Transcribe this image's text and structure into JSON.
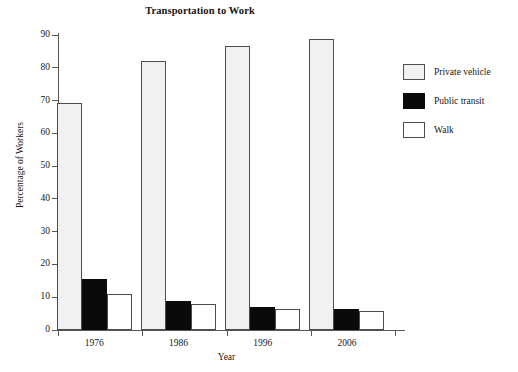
{
  "chart_data": {
    "type": "bar",
    "title": "Transportation to Work",
    "xlabel": "Year",
    "ylabel": "Percentage of Workers",
    "categories": [
      "1976",
      "1986",
      "1996",
      "2006"
    ],
    "series": [
      {
        "name": "Private vehicle",
        "color": "#f1f1f1",
        "values": [
          69.3,
          82.0,
          86.5,
          88.7
        ]
      },
      {
        "name": "Public transit",
        "color": "#0a0a0a",
        "values": [
          15.5,
          9.0,
          7.0,
          6.5
        ]
      },
      {
        "name": "Walk",
        "color": "#ffffff",
        "values": [
          11.0,
          8.0,
          6.5,
          5.7
        ]
      }
    ],
    "ylim": [
      0,
      90
    ],
    "yticks": [
      0,
      10,
      20,
      30,
      40,
      50,
      60,
      70,
      80,
      90
    ],
    "ytick_labels": [
      "0",
      "10",
      "20",
      "30",
      "40",
      "50",
      "60",
      "70",
      "80",
      "90"
    ],
    "grid": false,
    "legend_position": "right"
  }
}
